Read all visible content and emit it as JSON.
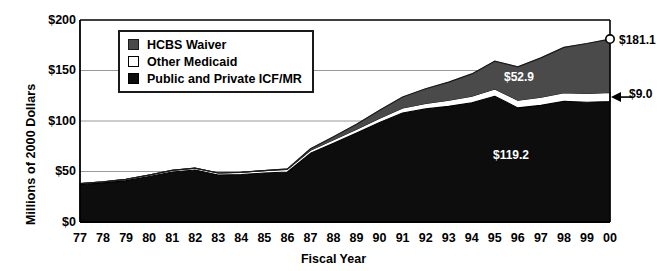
{
  "chart_data": {
    "type": "area",
    "stacked": true,
    "title": "",
    "xlabel": "Fiscal Year",
    "ylabel": "Millions of 2000 Dollars",
    "ylim": [
      0,
      200
    ],
    "yticks": [
      "$0",
      "$50",
      "$100",
      "$150",
      "$200"
    ],
    "ytick_values": [
      0,
      50,
      100,
      150,
      200
    ],
    "grid": true,
    "legend_position": "upper-left-inside",
    "categories": [
      "77",
      "78",
      "79",
      "80",
      "81",
      "82",
      "83",
      "84",
      "85",
      "86",
      "87",
      "88",
      "89",
      "90",
      "91",
      "92",
      "93",
      "94",
      "95",
      "96",
      "97",
      "98",
      "99",
      "00"
    ],
    "series": [
      {
        "name": "Public and Private ICF/MR",
        "color": "#0d0d0d",
        "values": [
          37.0,
          38.5,
          41.0,
          45.0,
          49.5,
          51.5,
          46.5,
          47.0,
          48.5,
          49.5,
          68.0,
          78.0,
          88.0,
          98.5,
          108.0,
          112.0,
          114.5,
          118.0,
          124.5,
          113.0,
          115.5,
          119.5,
          118.5,
          119.2
        ]
      },
      {
        "name": "Other Medicaid",
        "color": "#ffffff",
        "values": [
          1.0,
          1.2,
          1.3,
          1.5,
          1.7,
          1.8,
          2.0,
          2.2,
          2.4,
          2.6,
          3.0,
          3.4,
          3.8,
          4.2,
          4.8,
          5.4,
          6.0,
          6.6,
          7.2,
          7.6,
          8.0,
          8.4,
          8.7,
          9.0
        ]
      },
      {
        "name": "HCBS Waiver",
        "color": "#4a4a4a",
        "values": [
          0.0,
          0.0,
          0.0,
          0.0,
          0.0,
          0.0,
          0.0,
          0.0,
          0.0,
          0.5,
          1.5,
          3.0,
          5.0,
          8.0,
          11.0,
          14.5,
          18.0,
          22.0,
          27.5,
          33.0,
          39.0,
          45.0,
          49.5,
          52.9
        ]
      }
    ],
    "annotations": [
      {
        "name": "hcbs-waiver-value",
        "label": "$52.9",
        "x_px": 504,
        "y_px": 70,
        "color": "white"
      },
      {
        "name": "icfmr-value",
        "label": "$119.2",
        "x_px": 493,
        "y_px": 148,
        "color": "white"
      },
      {
        "name": "total-value",
        "label": "$181.1",
        "x_px": 619,
        "y_px": 33,
        "color": "black"
      },
      {
        "name": "other-medicaid-value",
        "label": "$9.0",
        "x_px": 629,
        "y_px": 87,
        "color": "black"
      }
    ]
  },
  "yaxis": {
    "title": "Millions of 2000 Dollars",
    "ticks": [
      {
        "label": "$200",
        "value": 200
      },
      {
        "label": "$150",
        "value": 150
      },
      {
        "label": "$100",
        "value": 100
      },
      {
        "label": "$50",
        "value": 50
      },
      {
        "label": "$0",
        "value": 0
      }
    ]
  },
  "xaxis": {
    "title": "Fiscal Year",
    "ticks": [
      "77",
      "78",
      "79",
      "80",
      "81",
      "82",
      "83",
      "84",
      "85",
      "86",
      "87",
      "88",
      "89",
      "90",
      "91",
      "92",
      "93",
      "94",
      "95",
      "96",
      "97",
      "98",
      "99",
      "00"
    ]
  },
  "legend": {
    "items": [
      {
        "label": "HCBS Waiver",
        "swatch": "dark-gray-square",
        "color": "#4a4a4a"
      },
      {
        "label": "Other Medicaid",
        "swatch": "white-square",
        "color": "#ffffff"
      },
      {
        "label": "Public and Private ICF/MR",
        "swatch": "black-square",
        "color": "#0d0d0d"
      }
    ]
  },
  "colors": {
    "hcbs_waiver": "#4a4a4a",
    "other_medicaid": "#ffffff",
    "icfmr": "#0d0d0d",
    "axis": "#000000",
    "gridline": "#9a9a9a"
  }
}
